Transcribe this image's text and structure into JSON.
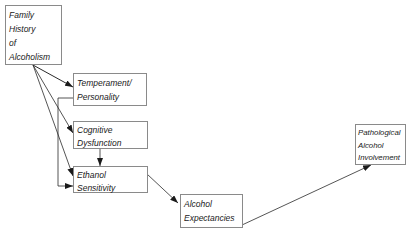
{
  "diagram": {
    "nodes": {
      "family_history": {
        "lines": [
          "Family",
          "History",
          "of",
          "Alcoholism"
        ]
      },
      "temperament": {
        "lines": [
          "Temperament/",
          "Personality"
        ]
      },
      "cognitive": {
        "lines": [
          "Cognitive",
          "Dysfunction"
        ]
      },
      "ethanol": {
        "lines": [
          "Ethanol",
          "Sensitivity"
        ]
      },
      "expectancies": {
        "lines": [
          "Alcohol",
          "Expectancies"
        ]
      },
      "pathological": {
        "lines": [
          "Pathological",
          "Alcohol",
          "Involvement"
        ]
      }
    },
    "edges": [
      {
        "from": "Family History of Alcoholism",
        "to": "Temperament/Personality"
      },
      {
        "from": "Family History of Alcoholism",
        "to": "Cognitive Dysfunction"
      },
      {
        "from": "Family History of Alcoholism",
        "to": "Ethanol Sensitivity"
      },
      {
        "from": "Temperament/Personality",
        "to": "Ethanol Sensitivity"
      },
      {
        "from": "Cognitive Dysfunction",
        "to": "Ethanol Sensitivity"
      },
      {
        "from": "Ethanol Sensitivity",
        "to": "Alcohol Expectancies"
      },
      {
        "from": "Alcohol Expectancies",
        "to": "Pathological Alcohol Involvement"
      }
    ],
    "colors": {
      "line": "#2a2a2a",
      "border": "#8a8a8a",
      "text": "#1a1a1a"
    }
  }
}
